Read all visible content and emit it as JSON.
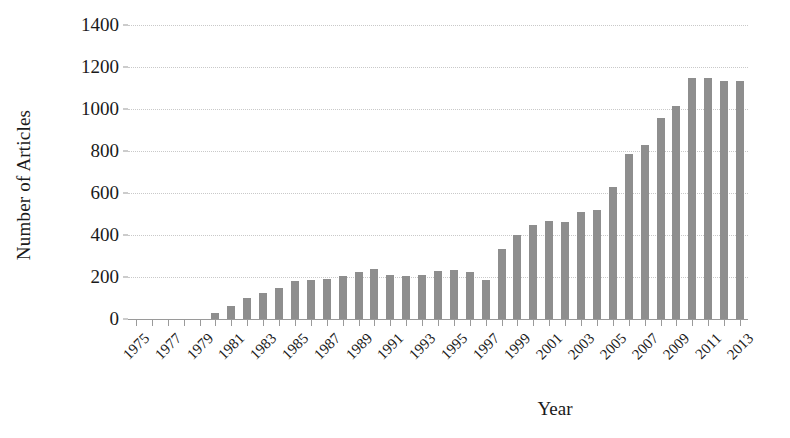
{
  "chart_data": {
    "type": "bar",
    "title": "",
    "xlabel": "Year",
    "ylabel": "Number of Articles",
    "ylim": [
      0,
      1400
    ],
    "ytick_step": 200,
    "yticks": [
      0,
      200,
      400,
      600,
      800,
      1000,
      1200,
      1400
    ],
    "ytick_labels": [
      "0",
      "200",
      "400",
      "600",
      "800",
      "1000",
      "1200",
      "1400"
    ],
    "grid": true,
    "legend": null,
    "bar_color": "#8e8e8e",
    "xtick_label_rotation": -45,
    "xtick_labels_shown": [
      "1975",
      "1977",
      "1979",
      "1981",
      "1983",
      "1985",
      "1987",
      "1989",
      "1991",
      "1993",
      "1995",
      "1997",
      "1999",
      "2001",
      "2003",
      "2005",
      "2007",
      "2009",
      "2011",
      "2013"
    ],
    "categories": [
      "1975",
      "1976",
      "1977",
      "1978",
      "1979",
      "1980",
      "1981",
      "1982",
      "1983",
      "1984",
      "1985",
      "1986",
      "1987",
      "1988",
      "1989",
      "1990",
      "1991",
      "1992",
      "1993",
      "1994",
      "1995",
      "1996",
      "1997",
      "1998",
      "1999",
      "2000",
      "2001",
      "2002",
      "2003",
      "2004",
      "2005",
      "2006",
      "2007",
      "2008",
      "2009",
      "2010",
      "2011",
      "2012",
      "2013"
    ],
    "values": [
      0,
      0,
      0,
      0,
      0,
      30,
      60,
      100,
      125,
      150,
      180,
      185,
      190,
      205,
      225,
      240,
      210,
      205,
      210,
      230,
      235,
      225,
      185,
      335,
      400,
      450,
      465,
      460,
      510,
      520,
      630,
      785,
      830,
      955,
      1015,
      1150,
      1150,
      1135,
      1135
    ]
  }
}
